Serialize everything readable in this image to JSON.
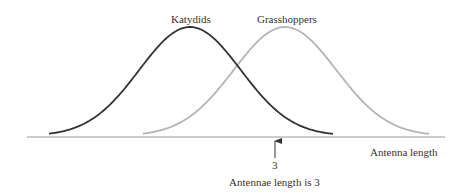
{
  "diagram": {
    "curves": [
      {
        "name": "Katydids",
        "color": "#333333",
        "peak_x": 190,
        "peak_y": 27,
        "start_x": 49,
        "end_x": 333
      },
      {
        "name": "Grasshoppers",
        "color": "#b4b4b4",
        "peak_x": 285,
        "peak_y": 27,
        "start_x": 143,
        "end_x": 430
      }
    ],
    "labels": {
      "katydids": "Katydids",
      "grasshoppers": "Grasshoppers",
      "axis": "Antenna length",
      "tick": "3",
      "annotation": "Antennae length is 3"
    },
    "colors": {
      "axis": "#999999",
      "arrow": "#333333",
      "text": "#333333"
    }
  },
  "chart_data": {
    "type": "line",
    "title": "",
    "xlabel": "Antenna length",
    "ylabel": "",
    "series": [
      {
        "name": "Katydids",
        "description": "bell-shaped distribution, peaks left of 3"
      },
      {
        "name": "Grasshoppers",
        "description": "bell-shaped distribution, peaks right of 3"
      }
    ],
    "annotations": [
      {
        "x": 3,
        "text": "Antennae length is 3"
      }
    ],
    "grid": false
  }
}
